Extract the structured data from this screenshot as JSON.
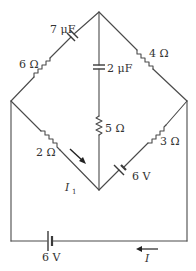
{
  "diagram": {
    "type": "circuit",
    "nodes": {
      "top": [
        99,
        12
      ],
      "left": [
        11,
        101
      ],
      "right": [
        187,
        101
      ],
      "bottom": [
        99,
        190
      ]
    },
    "components": [
      {
        "id": "c7",
        "type": "capacitor",
        "branch": "left-top",
        "label": "7 μF"
      },
      {
        "id": "r6",
        "type": "resistor",
        "branch": "left-top",
        "label": "6 Ω"
      },
      {
        "id": "r4",
        "type": "resistor",
        "branch": "top-right",
        "label": "4 Ω"
      },
      {
        "id": "c2",
        "type": "capacitor",
        "branch": "top-bottom",
        "label": "2 μF"
      },
      {
        "id": "r5",
        "type": "resistor",
        "branch": "top-bottom",
        "label": "5 Ω"
      },
      {
        "id": "r2",
        "type": "resistor",
        "branch": "left-bottom",
        "label": "2 Ω"
      },
      {
        "id": "r3",
        "type": "resistor",
        "branch": "right-bottom",
        "label": "3 Ω"
      },
      {
        "id": "b6a",
        "type": "battery",
        "branch": "right-bottom",
        "label": "6 V"
      },
      {
        "id": "b6b",
        "type": "battery",
        "branch": "outer-bottom",
        "label": "6 V"
      }
    ],
    "labels": {
      "cap7": "7 μF",
      "res6": "6 Ω",
      "res4": "4 Ω",
      "cap2": "2 μF",
      "res5": "5 Ω",
      "res2": "2 Ω",
      "res3": "3 Ω",
      "bat_inner": "6 V",
      "bat_outer": "6 V",
      "current_i1": "I",
      "current_i1_sub": "1",
      "current_i": "I"
    },
    "currents": [
      {
        "name": "I1",
        "direction": "down-right toward bottom node along 2 Ω branch"
      },
      {
        "name": "I",
        "direction": "leftward along bottom wire"
      }
    ]
  }
}
